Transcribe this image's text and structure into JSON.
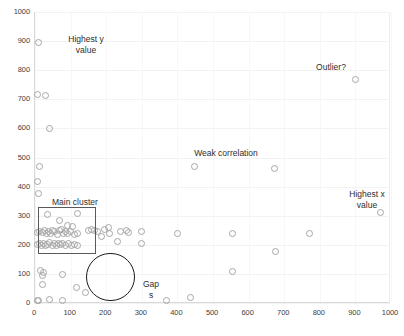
{
  "chart_data": {
    "type": "scatter",
    "title": "",
    "xlabel": "",
    "ylabel": "",
    "xlim": [
      0,
      1000
    ],
    "ylim": [
      0,
      1000
    ],
    "xticks": [
      0,
      100,
      200,
      300,
      400,
      500,
      600,
      700,
      800,
      900,
      1000
    ],
    "yticks": [
      0,
      100,
      200,
      300,
      400,
      500,
      600,
      700,
      800,
      900,
      1000
    ],
    "grid": true,
    "legend": "none",
    "marker": {
      "shape": "circle",
      "fill": "none",
      "edge_color": "#a6a6a6",
      "size": 7
    },
    "points": [
      [
        10,
        895
      ],
      [
        8,
        718
      ],
      [
        30,
        712
      ],
      [
        42,
        598
      ],
      [
        14,
        468
      ],
      [
        8,
        418
      ],
      [
        10,
        378
      ],
      [
        36,
        305
      ],
      [
        120,
        308
      ],
      [
        70,
        282
      ],
      [
        92,
        268
      ],
      [
        104,
        262
      ],
      [
        8,
        243
      ],
      [
        14,
        245
      ],
      [
        20,
        242
      ],
      [
        26,
        248
      ],
      [
        32,
        240
      ],
      [
        38,
        246
      ],
      [
        44,
        238
      ],
      [
        50,
        250
      ],
      [
        56,
        244
      ],
      [
        62,
        236
      ],
      [
        68,
        248
      ],
      [
        74,
        252
      ],
      [
        80,
        240
      ],
      [
        86,
        244
      ],
      [
        92,
        238
      ],
      [
        100,
        246
      ],
      [
        110,
        235
      ],
      [
        118,
        240
      ],
      [
        6,
        200
      ],
      [
        12,
        203
      ],
      [
        18,
        198
      ],
      [
        24,
        205
      ],
      [
        30,
        196
      ],
      [
        36,
        202
      ],
      [
        42,
        208
      ],
      [
        48,
        199
      ],
      [
        54,
        203
      ],
      [
        60,
        197
      ],
      [
        66,
        206
      ],
      [
        72,
        200
      ],
      [
        78,
        204
      ],
      [
        86,
        198
      ],
      [
        94,
        203
      ],
      [
        102,
        196
      ],
      [
        110,
        202
      ],
      [
        118,
        199
      ],
      [
        150,
        250
      ],
      [
        158,
        252
      ],
      [
        166,
        248
      ],
      [
        176,
        245
      ],
      [
        196,
        252
      ],
      [
        206,
        258
      ],
      [
        208,
        240
      ],
      [
        186,
        230
      ],
      [
        240,
        245
      ],
      [
        256,
        248
      ],
      [
        262,
        242
      ],
      [
        300,
        246
      ],
      [
        232,
        212
      ],
      [
        300,
        205
      ],
      [
        16,
        110
      ],
      [
        24,
        104
      ],
      [
        20,
        96
      ],
      [
        76,
        98
      ],
      [
        22,
        62
      ],
      [
        8,
        8
      ],
      [
        10,
        10
      ],
      [
        40,
        12
      ],
      [
        78,
        8
      ],
      [
        142,
        36
      ],
      [
        116,
        52
      ],
      [
        370,
        8
      ],
      [
        448,
        470
      ],
      [
        400,
        240
      ],
      [
        436,
        20
      ],
      [
        556,
        238
      ],
      [
        556,
        108
      ],
      [
        672,
        462
      ],
      [
        676,
        178
      ],
      [
        770,
        240
      ],
      [
        900,
        768
      ],
      [
        970,
        310
      ]
    ],
    "annotations": [
      {
        "name": "highest-y-value",
        "text": "Highest y\nvalue"
      },
      {
        "name": "outlier",
        "text": "Outlier?"
      },
      {
        "name": "weak-correlation",
        "text": "Weak correlation"
      },
      {
        "name": "highest-x-value",
        "text": "Highest x\nvalue"
      },
      {
        "name": "main-cluster",
        "text": "Main cluster"
      },
      {
        "name": "gaps",
        "text": "Gap\ns"
      }
    ],
    "shapes": [
      {
        "name": "main-cluster-rectangle",
        "type": "rect",
        "x0": 10,
        "y0": 170,
        "x1": 175,
        "y1": 330,
        "stroke": "#595959"
      },
      {
        "name": "gap-circle",
        "type": "circle",
        "cx": 215,
        "cy": 90,
        "r": 68,
        "stroke": "#1a1a1a"
      }
    ]
  },
  "axes": {
    "y_tick_labels": [
      "1000",
      "900",
      "800",
      "700",
      "600",
      "500",
      "400",
      "300",
      "200",
      "100",
      "0"
    ],
    "x_tick_labels": [
      "0",
      "100",
      "200",
      "300",
      "400",
      "500",
      "600",
      "700",
      "800",
      "900",
      "1000"
    ]
  },
  "annotations": {
    "highest_y": "Highest y\nvalue",
    "outlier": "Outlier?",
    "weak_correlation": "Weak correlation",
    "highest_x": "Highest x\nvalue",
    "main_cluster": "Main cluster",
    "gaps": "Gap\ns"
  },
  "colors": {
    "marker_edge": "#a6a6a6",
    "grid": "#f2f2f2",
    "axis": "#d9d9d9",
    "rect_stroke": "#595959",
    "circle_stroke": "#1a1a1a",
    "text": "#2d2d2d"
  }
}
